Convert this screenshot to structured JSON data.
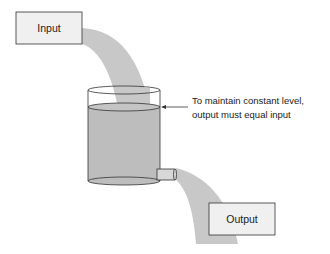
{
  "diagram": {
    "input_box": {
      "label": "Input"
    },
    "output_box": {
      "label": "Output"
    },
    "annotation": {
      "line1": "To maintain constant level,",
      "line2": "output must equal input"
    },
    "colors": {
      "stream": "#c8c8c8",
      "water": "#bdbdbd",
      "box_fill": "#f0f0f0",
      "stroke": "#333333"
    }
  }
}
